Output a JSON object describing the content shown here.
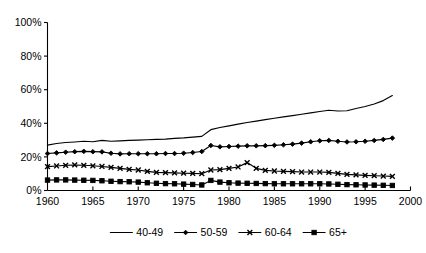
{
  "chart_data": {
    "type": "line",
    "title": "",
    "xlabel": "",
    "ylabel": "",
    "xlim": [
      1960,
      2000
    ],
    "ylim": [
      0,
      100
    ],
    "grid": false,
    "legend_position": "bottom",
    "x_ticks": [
      "1960",
      "1965",
      "1970",
      "1975",
      "1980",
      "1985",
      "1990",
      "1995",
      "2000"
    ],
    "x_tick_values": [
      1960,
      1965,
      1970,
      1975,
      1980,
      1985,
      1990,
      1995,
      2000
    ],
    "y_ticks": [
      "0%",
      "20%",
      "40%",
      "60%",
      "80%",
      "100%"
    ],
    "y_tick_values": [
      0,
      20,
      40,
      60,
      80,
      100
    ],
    "x": [
      1960,
      1961,
      1962,
      1963,
      1964,
      1965,
      1966,
      1967,
      1968,
      1969,
      1970,
      1971,
      1972,
      1973,
      1974,
      1975,
      1976,
      1977,
      1978,
      1979,
      1980,
      1981,
      1982,
      1983,
      1984,
      1985,
      1986,
      1987,
      1988,
      1989,
      1990,
      1991,
      1992,
      1993,
      1994,
      1995,
      1996,
      1997,
      1998
    ],
    "series": [
      {
        "name": "40-49",
        "marker": "none",
        "values": [
          27.0,
          28.0,
          28.6,
          28.9,
          29.3,
          29.0,
          29.8,
          29.3,
          29.5,
          29.8,
          30.0,
          30.2,
          30.4,
          30.6,
          31.0,
          31.3,
          31.8,
          32.2,
          36.2,
          37.5,
          38.5,
          39.5,
          40.5,
          41.3,
          42.2,
          43.0,
          43.8,
          44.6,
          45.4,
          46.2,
          47.0,
          47.8,
          47.3,
          47.5,
          48.8,
          50.0,
          51.5,
          53.5,
          56.5
        ]
      },
      {
        "name": "50-59",
        "marker": "diamond",
        "values": [
          22.0,
          22.4,
          22.8,
          23.1,
          23.3,
          23.1,
          23.0,
          22.2,
          21.8,
          21.9,
          21.9,
          21.9,
          21.9,
          22.0,
          22.0,
          22.2,
          22.6,
          23.2,
          26.8,
          26.0,
          26.2,
          26.4,
          26.6,
          26.6,
          26.7,
          26.9,
          27.2,
          27.6,
          28.2,
          29.0,
          29.6,
          29.8,
          29.3,
          28.9,
          29.0,
          29.3,
          29.8,
          30.4,
          31.2
        ]
      },
      {
        "name": "60-64",
        "marker": "x",
        "values": [
          14.2,
          14.6,
          15.0,
          15.2,
          15.0,
          14.7,
          14.3,
          13.8,
          13.2,
          12.6,
          12.2,
          11.4,
          10.8,
          10.6,
          10.5,
          10.3,
          10.2,
          10.0,
          12.2,
          12.4,
          13.2,
          14.0,
          16.6,
          13.2,
          12.0,
          11.6,
          11.4,
          11.2,
          11.0,
          11.0,
          11.0,
          10.8,
          10.2,
          9.6,
          9.3,
          9.0,
          8.8,
          8.6,
          8.4
        ]
      },
      {
        "name": "65+",
        "marker": "square",
        "values": [
          6.2,
          6.3,
          6.3,
          6.2,
          6.1,
          6.0,
          5.8,
          5.5,
          5.3,
          5.2,
          5.0,
          4.6,
          4.3,
          4.1,
          4.0,
          3.8,
          3.6,
          3.3,
          6.0,
          5.0,
          4.6,
          4.4,
          4.3,
          4.2,
          4.1,
          4.0,
          4.0,
          4.0,
          4.0,
          4.0,
          4.0,
          3.9,
          3.7,
          3.5,
          3.4,
          3.3,
          3.2,
          3.1,
          3.0
        ]
      }
    ],
    "legend": [
      {
        "label": "40-49",
        "marker": "none"
      },
      {
        "label": "50-59",
        "marker": "diamond"
      },
      {
        "label": "60-64",
        "marker": "x"
      },
      {
        "label": "65+",
        "marker": "square"
      }
    ]
  }
}
